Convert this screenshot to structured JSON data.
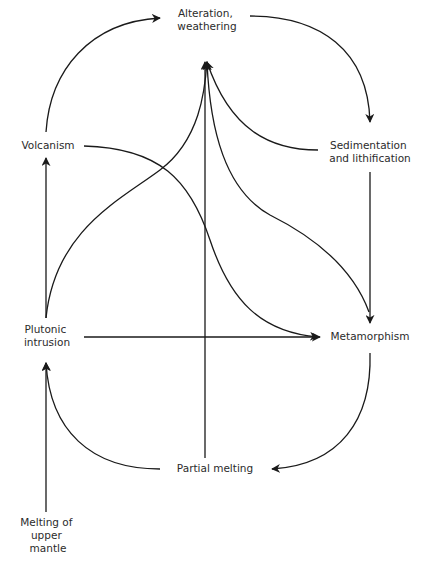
{
  "diagram": {
    "stroke_color": "#1a1a1a",
    "text_color": "#2b2b2b",
    "nodes": {
      "alteration": [
        "Alteration,",
        "weathering"
      ],
      "sedimentation": [
        "Sedimentation",
        "and lithification"
      ],
      "volcanism": [
        "Volcanism"
      ],
      "plutonic": [
        "Plutonic",
        "intrusion"
      ],
      "metamorphism": [
        "Metamorphism"
      ],
      "partial_melting": [
        "Partial melting"
      ],
      "mantle": [
        "Melting of",
        "upper",
        "mantle"
      ]
    },
    "edges": [
      {
        "from": "Volcanism",
        "to": "Alteration, weathering"
      },
      {
        "from": "Alteration, weathering",
        "to": "Sedimentation and lithification"
      },
      {
        "from": "Sedimentation and lithification",
        "to": "Metamorphism"
      },
      {
        "from": "Sedimentation and lithification",
        "to": "Alteration, weathering"
      },
      {
        "from": "Metamorphism",
        "to": "Alteration, weathering"
      },
      {
        "from": "Plutonic intrusion",
        "to": "Alteration, weathering"
      },
      {
        "from": "Partial melting",
        "to": "Alteration, weathering"
      },
      {
        "from": "Volcanism",
        "to": "Metamorphism"
      },
      {
        "from": "Plutonic intrusion",
        "to": "Metamorphism"
      },
      {
        "from": "Plutonic intrusion",
        "to": "Volcanism"
      },
      {
        "from": "Metamorphism",
        "to": "Partial melting"
      },
      {
        "from": "Partial melting",
        "to": "Plutonic intrusion"
      },
      {
        "from": "Melting of upper mantle",
        "to": "Plutonic intrusion"
      }
    ]
  }
}
